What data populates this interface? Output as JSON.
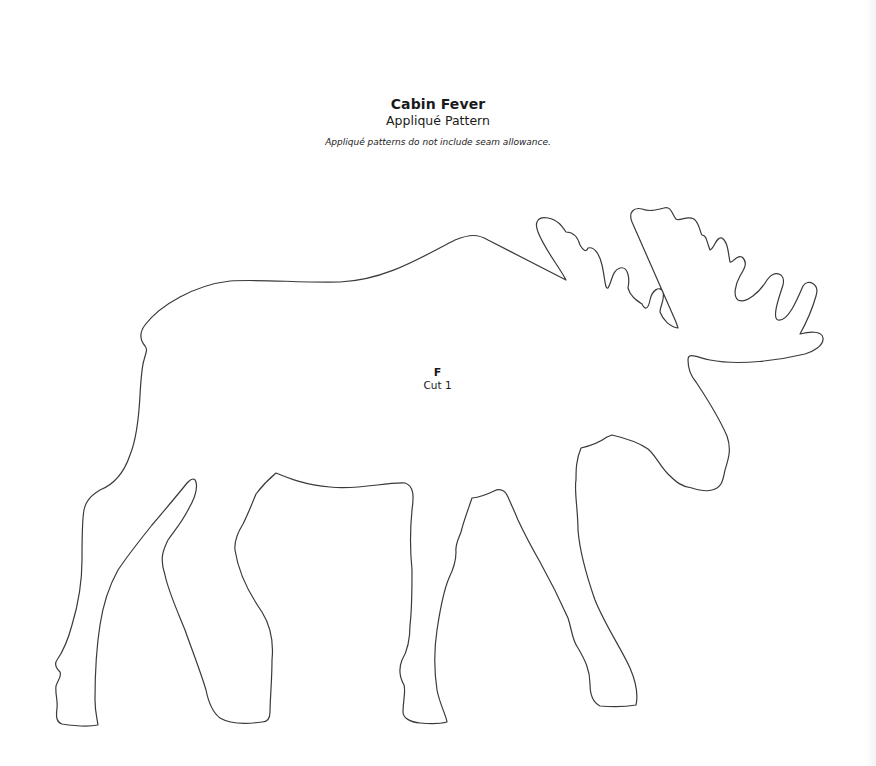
{
  "header": {
    "title": "Cabin Fever",
    "subtitle": "Appliqué Pattern",
    "note": "Appliqué patterns do not include seam allowance."
  },
  "pattern_piece": {
    "shape": "moose",
    "letter": "F",
    "cut_instruction": "Cut 1",
    "outline_color": "#3a3a3a"
  }
}
